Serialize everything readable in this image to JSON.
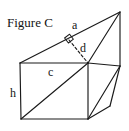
{
  "figure": {
    "title": "Figure C",
    "labels": {
      "slant_edge": "a",
      "height_dashed": "d",
      "top_edge": "c",
      "vertical_edge": "h"
    },
    "colors": {
      "stroke": "#1a1a1a",
      "background": "#ffffff",
      "text": "#141414"
    },
    "geometry": {
      "description": "oblique prism with triangular cross-section and inscribed diagonals",
      "vertices": {
        "front_top_left": [
          20,
          63
        ],
        "front_top_right": [
          88,
          63
        ],
        "front_bottom_left": [
          21,
          119
        ],
        "front_bottom_right": [
          88,
          119
        ],
        "apex_top_right": [
          120,
          12
        ],
        "right_middle": [
          120,
          66
        ],
        "lower_right": [
          110,
          106
        ]
      },
      "right_angle_marker": {
        "at": [
          69,
          40
        ],
        "size": 7
      },
      "dashed_segment": {
        "from": [
          69,
          40
        ],
        "to": [
          88,
          63
        ],
        "label": "d"
      }
    }
  }
}
